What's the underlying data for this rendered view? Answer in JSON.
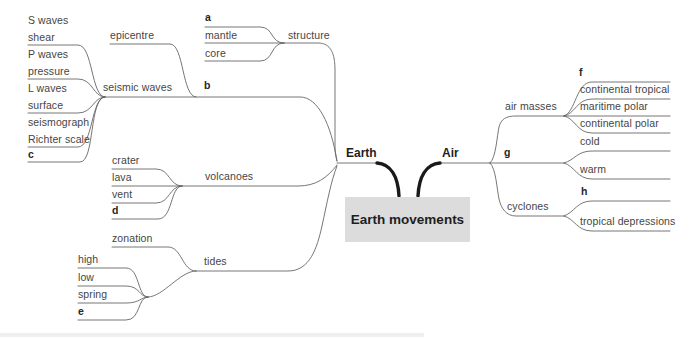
{
  "root": {
    "label": "Earth movements"
  },
  "hubs": {
    "earth": "Earth",
    "air": "Air"
  },
  "earth": {
    "structure": {
      "label": "structure",
      "terms": [
        "a",
        "mantle",
        "core"
      ]
    },
    "seismic_waves": {
      "label": "seismic waves",
      "letter": "b",
      "sub": "epicentre",
      "terms": [
        "S waves",
        "shear",
        "P waves",
        "pressure",
        "L waves",
        "surface",
        "seismograph",
        "Richter scale",
        "c"
      ]
    },
    "volcanoes": {
      "label": "volcanoes",
      "terms": [
        "crater",
        "lava",
        "vent",
        "d"
      ]
    },
    "tides": {
      "label": "tides",
      "sub": "zonation",
      "terms": [
        "high",
        "low",
        "spring",
        "e"
      ]
    }
  },
  "air": {
    "air_masses": {
      "label": "air masses",
      "terms": [
        "f",
        "continental tropical",
        "maritime polar",
        "continental polar"
      ]
    },
    "fronts": {
      "label": "g",
      "terms": [
        "cold",
        "warm"
      ]
    },
    "cyclones": {
      "label": "cyclones",
      "terms": [
        "h",
        "tropical depressions"
      ]
    }
  },
  "colors": {
    "line": "#666666",
    "thick_line": "#1a1a1a",
    "text": "#454545",
    "box_bg": "#dcdcdc"
  }
}
